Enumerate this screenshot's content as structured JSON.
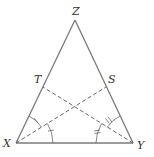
{
  "diagram": {
    "type": "isosceles triangle with angle bisectors",
    "colors": {
      "side": "#7a7a7a",
      "dashed": "#555555",
      "label": "#333333",
      "background": "#ffffff"
    },
    "vertices": {
      "Z": {
        "label": "Z"
      },
      "X": {
        "label": "X"
      },
      "Y": {
        "label": "Y"
      },
      "T": {
        "label": "T"
      },
      "S": {
        "label": "S"
      }
    },
    "segments": [
      {
        "from": "X",
        "to": "Y",
        "style": "solid"
      },
      {
        "from": "X",
        "to": "Z",
        "style": "solid"
      },
      {
        "from": "Y",
        "to": "Z",
        "style": "solid"
      },
      {
        "from": "X",
        "to": "S",
        "style": "dashed"
      },
      {
        "from": "Y",
        "to": "T",
        "style": "dashed"
      }
    ],
    "angle_marks": [
      {
        "vertex": "X",
        "between": [
          "XY",
          "XS"
        ],
        "ticks": 1
      },
      {
        "vertex": "X",
        "between": [
          "XS",
          "XT"
        ],
        "ticks": 1
      },
      {
        "vertex": "Y",
        "between": [
          "YX",
          "YT"
        ],
        "ticks": 2
      },
      {
        "vertex": "Y",
        "between": [
          "YT",
          "YS"
        ],
        "ticks": 2
      }
    ]
  }
}
